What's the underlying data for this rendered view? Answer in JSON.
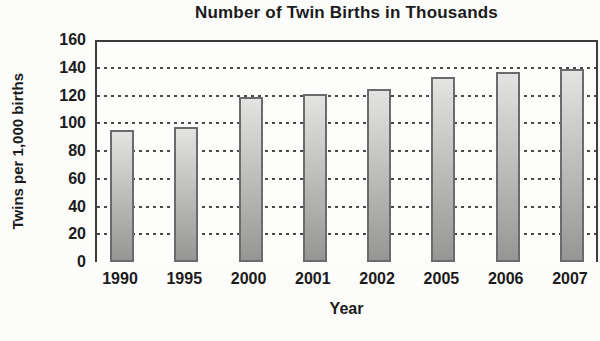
{
  "chart_data": {
    "type": "bar",
    "title": "Number of Twin Births in Thousands",
    "xlabel": "Year",
    "ylabel": "Twins per 1,000 births",
    "categories": [
      "1990",
      "1995",
      "2000",
      "2001",
      "2002",
      "2005",
      "2006",
      "2007"
    ],
    "values": [
      95,
      97,
      119,
      121,
      125,
      133,
      137,
      139
    ],
    "ylim": [
      0,
      160
    ],
    "yticks": [
      0,
      20,
      40,
      60,
      80,
      100,
      120,
      140,
      160
    ],
    "grid": "horizontal-dotted",
    "legend_position": "none",
    "colors": {
      "bar_gradient_top": "#e3e3e2",
      "bar_gradient_bottom": "#969694",
      "bar_border": "#6b6b6b",
      "grid_line": "#4a4a4a",
      "plot_border": "#3c3c3c",
      "text": "#1b1b1b",
      "background": "#fcfcfb"
    }
  }
}
